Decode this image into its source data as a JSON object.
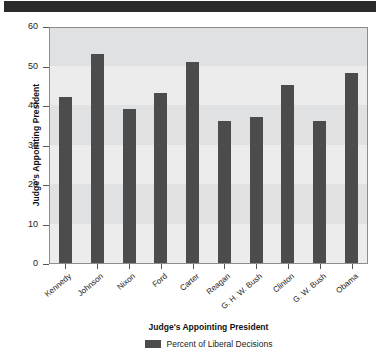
{
  "banner": {
    "color": "#2b2b2b"
  },
  "chart_data": {
    "type": "bar",
    "title": "",
    "xlabel": "Judge's Appointing President",
    "ylabel": "Judge's Appointing President",
    "ylim": [
      0,
      60
    ],
    "ytick_step": 10,
    "yticks": [
      "0",
      "10",
      "20",
      "30",
      "40",
      "50",
      "60"
    ],
    "grid": "alternating-horizontal-bands",
    "legend_position": "bottom-center",
    "bar_color": "#4c4c4c",
    "plot_background": "#ececed",
    "band_color": "#e0e1e2",
    "categories": [
      "Kennedy",
      "Johnson",
      "Nixon",
      "Ford",
      "Carter",
      "Reagan",
      "G. H. W. Bush",
      "Clinton",
      "G. W. Bush",
      "Obama"
    ],
    "series": [
      {
        "name": "Percent of Liberal Decisions",
        "values": [
          42,
          53,
          39,
          43,
          51,
          36,
          37,
          45,
          36,
          48
        ]
      }
    ]
  },
  "legend": {
    "entries": [
      {
        "label": "Percent of Liberal Decisions",
        "color": "#4c4c4c"
      }
    ]
  }
}
